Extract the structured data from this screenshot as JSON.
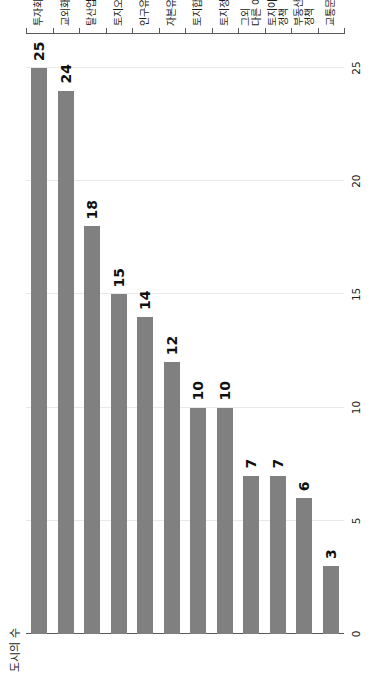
{
  "chart_data": {
    "type": "bar",
    "orientation": "horizontal",
    "title": "",
    "xlabel": "",
    "ylabel": "도시의 수",
    "value_axis_title": "도시의 수",
    "categories": [
      "투자회수",
      "교외화",
      "탈산업화",
      "토지오염",
      "인구유출",
      "자본유입",
      "토지합병",
      "토지정형화",
      "그외 다른 이유",
      "토지이용 정책",
      "부동산세 정책",
      "교통문제"
    ],
    "category_lines": [
      [
        "투자회수"
      ],
      [
        "교외화"
      ],
      [
        "탈산업화"
      ],
      [
        "토지오염"
      ],
      [
        "인구유출"
      ],
      [
        "자본유입"
      ],
      [
        "토지합병"
      ],
      [
        "토지정형화"
      ],
      [
        "그외",
        "다른 이유"
      ],
      [
        "토지이용",
        "정책"
      ],
      [
        "부동산세",
        "정책"
      ],
      [
        "교통문제"
      ]
    ],
    "values": [
      25,
      24,
      18,
      15,
      14,
      12,
      10,
      10,
      7,
      7,
      6,
      3
    ],
    "value_labels": [
      "25",
      "24",
      "18",
      "15",
      "14",
      "12",
      "10",
      "10",
      "7",
      "7",
      "6",
      "3"
    ],
    "ticks": [
      0,
      5,
      10,
      15,
      20,
      25
    ],
    "tick_labels": [
      "0",
      "5",
      "10",
      "15",
      "20",
      "25"
    ],
    "xlim": [
      0,
      26.5
    ],
    "grid": true,
    "grid_axis": "value",
    "legend": false,
    "bar_color": "#808080",
    "grid_color": "#e9e9e9",
    "axis_color": "#5a5a5a",
    "text_color": "#1b1b1b",
    "background": "#ffffff"
  }
}
